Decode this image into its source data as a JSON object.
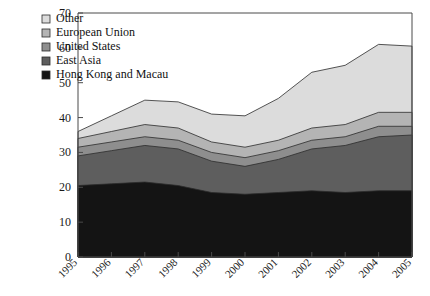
{
  "chart_data": {
    "type": "area",
    "stacked": true,
    "title": "",
    "xlabel": "",
    "ylabel": "",
    "categories": [
      "1995",
      "1996",
      "1997",
      "1998",
      "1999",
      "2000",
      "2001",
      "2002",
      "2003",
      "2004",
      "2005"
    ],
    "x": [
      1995,
      1996,
      1997,
      1998,
      1999,
      2000,
      2001,
      2002,
      2003,
      2004,
      2005
    ],
    "ylim": [
      0,
      70
    ],
    "yticks": [
      0,
      10,
      20,
      30,
      40,
      50,
      60,
      70
    ],
    "ytick_labels": [
      "0",
      "10",
      "20",
      "30",
      "40",
      "50",
      "60",
      "70"
    ],
    "grid": false,
    "legend_position": "top-left",
    "series": [
      {
        "name": "Hong Kong and Macau",
        "color": "#141414",
        "values": [
          20.5,
          21.0,
          21.5,
          20.5,
          18.5,
          18.0,
          18.5,
          19.0,
          18.5,
          19.0,
          19.0
        ]
      },
      {
        "name": "East Asia",
        "color": "#5e5e5e",
        "values": [
          8.5,
          9.5,
          10.5,
          10.5,
          9.0,
          8.0,
          9.5,
          12.0,
          13.5,
          15.5,
          16.0
        ]
      },
      {
        "name": "United States",
        "color": "#8e8e8e",
        "values": [
          2.5,
          2.5,
          2.5,
          2.5,
          2.5,
          2.5,
          2.5,
          2.5,
          2.5,
          3.0,
          2.5
        ]
      },
      {
        "name": "European Union",
        "color": "#b4b4b4",
        "values": [
          2.5,
          3.0,
          3.5,
          3.5,
          3.0,
          3.0,
          3.0,
          3.5,
          3.5,
          4.0,
          4.0
        ]
      },
      {
        "name": "Other",
        "color": "#dcdcdc",
        "values": [
          2.0,
          4.5,
          7.0,
          7.5,
          8.0,
          9.0,
          12.0,
          16.0,
          17.0,
          19.5,
          19.0
        ]
      }
    ],
    "cumulative_totals": [
      36.0,
      40.5,
      45.0,
      44.5,
      41.0,
      40.5,
      45.5,
      53.0,
      55.0,
      61.0,
      60.5
    ]
  },
  "legend": {
    "items": [
      {
        "label": "Other",
        "swatch": "legend-swatch-other"
      },
      {
        "label": "European Union",
        "swatch": "legend-swatch-european-union"
      },
      {
        "label": "United States",
        "swatch": "legend-swatch-united-states"
      },
      {
        "label": "East Asia",
        "swatch": "legend-swatch-east-asia"
      },
      {
        "label": "Hong Kong and Macau",
        "swatch": "legend-swatch-hong-kong-and-macau"
      }
    ]
  }
}
